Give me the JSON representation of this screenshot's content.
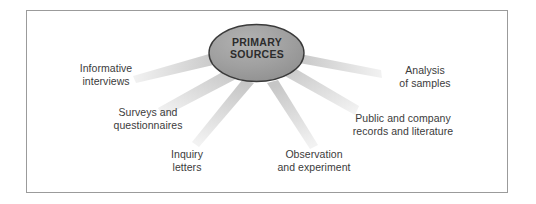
{
  "diagram": {
    "title": "Primary Sources",
    "hub": {
      "name": "primary-sources-hub",
      "line1": "PRIMARY",
      "line2": "SOURCES",
      "fill_color": "#9c9c9c",
      "stroke_color": "#3a3a3a",
      "text_color": "#2c2c2c"
    },
    "spoke_color": "#d7d7d7",
    "label_color": "#3b3b3b",
    "frame_color": "#9b9b9b",
    "background_color": "#ffffff",
    "nodes": [
      {
        "id": "informative-interviews",
        "line1": "Informative",
        "line2": "interviews"
      },
      {
        "id": "surveys-and-questionnaires",
        "line1": "Surveys and",
        "line2": "questionnaires"
      },
      {
        "id": "inquiry-letters",
        "line1": "Inquiry",
        "line2": "letters"
      },
      {
        "id": "observation-and-experiment",
        "line1": "Observation",
        "line2": "and experiment"
      },
      {
        "id": "public-and-company-records",
        "line1": "Public and company",
        "line2": "records and literature"
      },
      {
        "id": "analysis-of-samples",
        "line1": "Analysis",
        "line2": "of samples"
      }
    ]
  }
}
